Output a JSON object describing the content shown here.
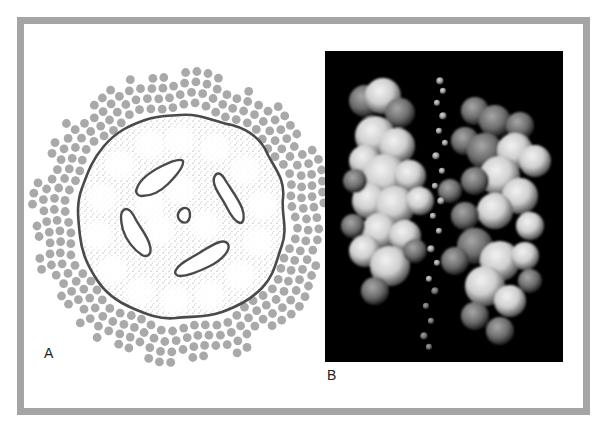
{
  "figure": {
    "panels": [
      {
        "id": "A",
        "label": "A",
        "description": "Schematic cross-section of a transmembrane pore complex surrounded by lipid molecules",
        "elements": [
          "lipid-dots-ring",
          "stippled-protein-body",
          "wavy-outer-boundary",
          "four-channel-pores",
          "central-pore"
        ]
      },
      {
        "id": "B",
        "label": "B",
        "description": "Surface rendering of protein subunits with a chain of water molecules in the central channel",
        "elements": [
          "left-protein-lobe",
          "right-protein-lobe",
          "water-bead-chain"
        ]
      }
    ],
    "colors": {
      "frame": "#a5a5a5",
      "lipid_dot": "#a9a9a9",
      "outline": "#4a4a4a",
      "stipple": "#777777",
      "panel_b_background": "#000000",
      "label_text": "#222222"
    }
  }
}
